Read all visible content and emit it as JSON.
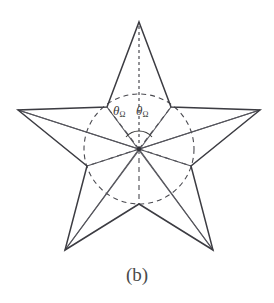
{
  "figure": {
    "caption": "(b)",
    "alt_title": "Five-pointed star with inscribed circle and central angles",
    "colors": {
      "background": "#ffffff",
      "outline": "#3c3c42",
      "chord": "#55555c",
      "dashed": "#4a4a50",
      "text": "#3a3a3a"
    },
    "geometry": {
      "center": {
        "x": 139,
        "y": 149
      },
      "outer_radius": 127,
      "inner_radius": 55,
      "point_count": 5,
      "outer_points": [
        {
          "name": "apex-top",
          "x": 139,
          "y": 22
        },
        {
          "name": "point-right",
          "x": 260,
          "y": 110
        },
        {
          "name": "point-bottom-right",
          "x": 213,
          "y": 250
        },
        {
          "name": "point-bottom-left",
          "x": 65,
          "y": 250
        },
        {
          "name": "point-left",
          "x": 18,
          "y": 110
        }
      ],
      "inner_points": [
        {
          "name": "inner-upper-right",
          "x": 171,
          "y": 107
        },
        {
          "name": "inner-right",
          "x": 191,
          "y": 166
        },
        {
          "name": "inner-bottom",
          "x": 139,
          "y": 204
        },
        {
          "name": "inner-left",
          "x": 87,
          "y": 166
        },
        {
          "name": "inner-upper-left",
          "x": 107,
          "y": 107
        }
      ]
    },
    "angle_markers": [
      {
        "id": "theta-left",
        "symbol": "θ",
        "subscript": "Ω"
      },
      {
        "id": "theta-right",
        "symbol": "θ",
        "subscript": "Ω"
      }
    ],
    "elements": {
      "circle_label": "inscribed-dashed-circle",
      "axis_label": "vertical-dashed-axis",
      "arc_label": "central-angle-arc"
    }
  }
}
